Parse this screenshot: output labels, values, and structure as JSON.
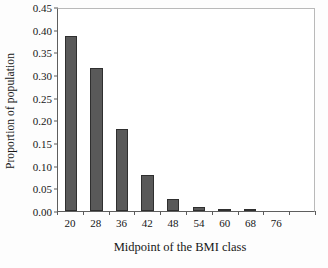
{
  "chart_data": {
    "type": "bar",
    "title": "",
    "xlabel": "Midpoint of the BMI class",
    "ylabel": "Proportion of population",
    "categories": [
      "20",
      "28",
      "36",
      "42",
      "48",
      "54",
      "60",
      "68",
      "76"
    ],
    "values": [
      0.387,
      0.316,
      0.181,
      0.079,
      0.027,
      0.008,
      0.003,
      0.001,
      0.0
    ],
    "ylim": [
      0.0,
      0.45
    ],
    "ytick_labels": [
      "0.00",
      "0.05",
      "0.10",
      "0.15",
      "0.20",
      "0.25",
      "0.30",
      "0.35",
      "0.40",
      "0.45"
    ],
    "ytick_values": [
      0.0,
      0.05,
      0.1,
      0.15,
      0.2,
      0.25,
      0.3,
      0.35,
      0.4,
      0.45
    ],
    "grid": false,
    "legend": "none",
    "bar_color": "#595959",
    "bar_edge_color": "#2f2f2f",
    "axis_color": "#5e5e5e",
    "frame_color": "#b9b9b9",
    "background": "#ffffff",
    "n_slots": 10
  }
}
